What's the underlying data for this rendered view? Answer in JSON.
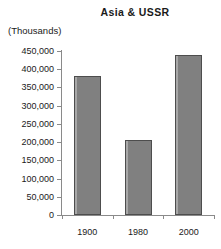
{
  "chart_data": {
    "type": "bar",
    "title": "Asia & USSR",
    "subtitle": "",
    "unit_label": "(Thousands)",
    "xlabel": "",
    "ylabel": "",
    "categories": [
      "1900",
      "1980",
      "2000"
    ],
    "values": [
      381000,
      206000,
      439000
    ],
    "ylim": [
      0,
      450000
    ],
    "ytick_labels": [
      "450,000",
      "400,000",
      "350,000",
      "300,000",
      "250,000",
      "200,000",
      "150,000",
      "100,000",
      "50,000",
      "0"
    ],
    "ytick_values": [
      450000,
      400000,
      350000,
      300000,
      250000,
      200000,
      150000,
      100000,
      50000,
      0
    ],
    "grid": false,
    "legend": false,
    "bar_color": "#808080",
    "bar_border_color": "#4d4d4d",
    "axis_color": "#8a8a8a"
  }
}
